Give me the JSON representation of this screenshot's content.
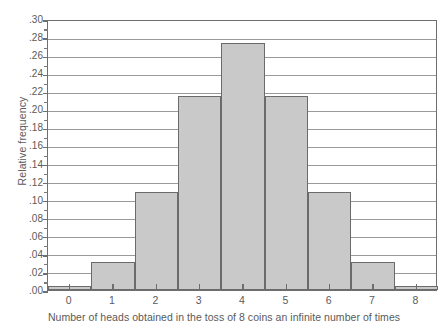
{
  "chart_data": {
    "type": "bar",
    "title": "",
    "xlabel": "Number of heads obtained in the toss of 8 coins an infinite number of times",
    "ylabel": "Relative frequency",
    "categories": [
      "0",
      "1",
      "2",
      "3",
      "4",
      "5",
      "6",
      "7",
      "8"
    ],
    "values": [
      0.004,
      0.031,
      0.109,
      0.215,
      0.273,
      0.215,
      0.109,
      0.031,
      0.004
    ],
    "ylim": [
      0.0,
      0.3
    ],
    "ytick_step": 0.02,
    "ytick_labels": [
      ".00",
      ".02",
      ".04",
      ".06",
      ".08",
      ".10",
      ".12",
      ".14",
      ".16",
      ".18",
      ".20",
      ".22",
      ".24",
      ".26",
      ".28",
      ".30"
    ],
    "ytick_values": [
      0.0,
      0.02,
      0.04,
      0.06,
      0.08,
      0.1,
      0.12,
      0.14,
      0.16,
      0.18,
      0.2,
      0.22,
      0.24,
      0.26,
      0.28,
      0.3
    ],
    "minor_tick_values": [
      0.01,
      0.03,
      0.05,
      0.07,
      0.09,
      0.11,
      0.13,
      0.15,
      0.17,
      0.19,
      0.21,
      0.23,
      0.25,
      0.27,
      0.29
    ],
    "xlim": [
      -0.5,
      8.5
    ],
    "grid": true,
    "legend": null,
    "legend_position": "none",
    "bar_fill_color": "#c9c9c9",
    "bar_edge_color": "#6b6b6b",
    "gridline_color": "#9a9a9a",
    "axis_color": "#6e6e6e",
    "text_color": "#5a5a5a",
    "background_color": "#ffffff"
  }
}
